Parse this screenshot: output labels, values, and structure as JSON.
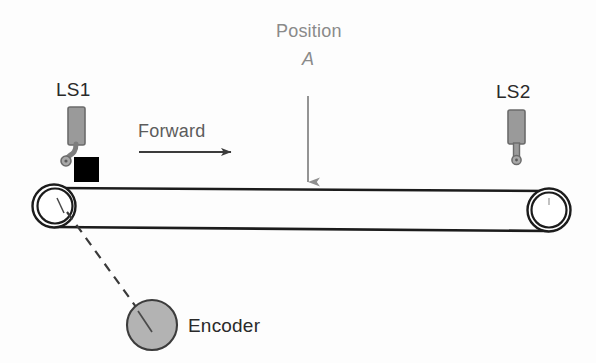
{
  "diagram": {
    "background_color": "#fdfdfd",
    "labels": {
      "ls1": "LS1",
      "ls2": "LS2",
      "forward": "Forward",
      "position": "Position",
      "position_marker": "A",
      "encoder": "Encoder"
    },
    "colors": {
      "line_dark": "#1c1c1c",
      "sensor_gray": "#9a9a9a",
      "sensor_outline": "#6e6e6e",
      "encoder_fill": "#b3b3b3",
      "encoder_outline": "#4a4a4a",
      "block_black": "#000000",
      "arrow_forward": "#3c3c3c",
      "arrow_position": "#8a8a8a",
      "text_dark": "#2a2a2a",
      "text_gray": "#8a8a8a"
    },
    "components": [
      {
        "name": "limit-switch-ls1",
        "label": "LS1",
        "type": "roller-lever-limit-switch",
        "x": 79,
        "y": 140
      },
      {
        "name": "limit-switch-ls2",
        "label": "LS2",
        "type": "plunger-limit-switch",
        "x": 517,
        "y": 140
      },
      {
        "name": "conveyor-belt",
        "type": "belt",
        "left_x": 54,
        "right_x": 549,
        "top_y": 188,
        "bottom_y": 227
      },
      {
        "name": "pulley-left",
        "type": "pulley",
        "cx": 54,
        "cy": 206,
        "r_outer": 22,
        "r_inner": 18
      },
      {
        "name": "pulley-right",
        "type": "pulley",
        "cx": 549,
        "cy": 210,
        "r_outer": 22,
        "r_inner": 18
      },
      {
        "name": "workpiece-block",
        "type": "block",
        "x": 74,
        "y": 157,
        "width": 24,
        "height": 24
      },
      {
        "name": "encoder",
        "label": "Encoder",
        "type": "encoder",
        "cx": 152,
        "cy": 325,
        "r": 25
      }
    ],
    "annotations": [
      {
        "name": "forward-direction-arrow",
        "label": "Forward",
        "from_x": 139,
        "to_x": 232,
        "y": 152
      },
      {
        "name": "position-a-arrow",
        "label": "Position A",
        "x": 308,
        "from_y": 95,
        "to_y": 184
      },
      {
        "name": "encoder-link",
        "style": "dashed",
        "from_x": 68,
        "from_y": 213,
        "to_x": 138,
        "to_y": 310
      }
    ]
  }
}
